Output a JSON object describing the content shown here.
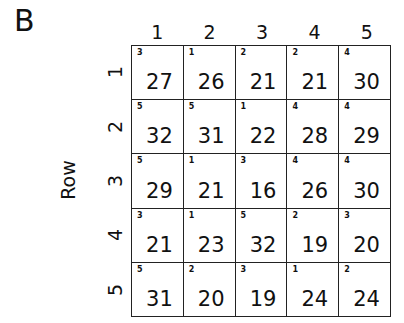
{
  "panel_label": "B",
  "row_axis_title": "Row",
  "column_labels": [
    "1",
    "2",
    "3",
    "4",
    "5"
  ],
  "row_labels": [
    "1",
    "2",
    "3",
    "4",
    "5"
  ],
  "rows": [
    {
      "cells": [
        {
          "sup": "3",
          "value": "27"
        },
        {
          "sup": "1",
          "value": "26"
        },
        {
          "sup": "2",
          "value": "21"
        },
        {
          "sup": "2",
          "value": "21"
        },
        {
          "sup": "4",
          "value": "30"
        }
      ]
    },
    {
      "cells": [
        {
          "sup": "5",
          "value": "32"
        },
        {
          "sup": "5",
          "value": "31"
        },
        {
          "sup": "1",
          "value": "22"
        },
        {
          "sup": "4",
          "value": "28"
        },
        {
          "sup": "4",
          "value": "29"
        }
      ]
    },
    {
      "cells": [
        {
          "sup": "5",
          "value": "29"
        },
        {
          "sup": "1",
          "value": "21"
        },
        {
          "sup": "3",
          "value": "16"
        },
        {
          "sup": "4",
          "value": "26"
        },
        {
          "sup": "4",
          "value": "30"
        }
      ]
    },
    {
      "cells": [
        {
          "sup": "3",
          "value": "21"
        },
        {
          "sup": "1",
          "value": "23"
        },
        {
          "sup": "5",
          "value": "32"
        },
        {
          "sup": "2",
          "value": "19"
        },
        {
          "sup": "3",
          "value": "20"
        }
      ]
    },
    {
      "cells": [
        {
          "sup": "5",
          "value": "31"
        },
        {
          "sup": "2",
          "value": "20"
        },
        {
          "sup": "3",
          "value": "19"
        },
        {
          "sup": "1",
          "value": "24"
        },
        {
          "sup": "2",
          "value": "24"
        }
      ]
    }
  ]
}
